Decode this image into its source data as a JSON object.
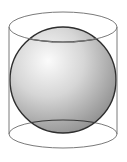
{
  "figure": {
    "colors": {
      "background": "#ffffff",
      "cylinder_stroke": "#7a7a7a",
      "sphere_outline": "#2e2e2e",
      "sphere_highlight": "#fbfbfb",
      "sphere_mid": "#d4d4d4",
      "sphere_shadow": "#8e8e8e",
      "cross_section_stroke": "#3a3a3a"
    },
    "cylinder": {
      "left_x": 9,
      "right_x": 117,
      "top_center_y": 27,
      "bottom_center_y": 134,
      "top_ry": 15,
      "bottom_ry": 14
    },
    "sphere": {
      "cx": 63,
      "cy": 80,
      "rx": 53,
      "ry": 53
    }
  }
}
